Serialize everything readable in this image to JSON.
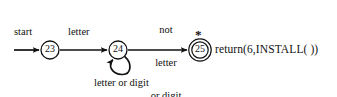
{
  "diagram": {
    "type": "finite-state-transition-diagram",
    "stroke_color": "#111111",
    "background_color": "#ffffff",
    "start_label": "start",
    "states": [
      {
        "id": "s23",
        "label": "23",
        "shape": "circle",
        "accepting": false,
        "cx": 50,
        "cy": 50,
        "r": 9
      },
      {
        "id": "s24",
        "label": "24",
        "shape": "circle",
        "accepting": false,
        "cx": 118,
        "cy": 50,
        "r": 9
      },
      {
        "id": "s25",
        "label": "25",
        "shape": "double-circle",
        "accepting": true,
        "cx": 200,
        "cy": 50,
        "r": 9,
        "r_outer": 11.5,
        "marker": "*"
      }
    ],
    "transitions": [
      {
        "id": "t-start",
        "from": "start",
        "to": "s23",
        "label": "start"
      },
      {
        "id": "t23-24",
        "from": "s23",
        "to": "s24",
        "label": "letter"
      },
      {
        "id": "t24-25",
        "from": "s24",
        "to": "s25",
        "label_lines": [
          "not",
          "letter",
          "or digit"
        ]
      },
      {
        "id": "t24-24",
        "from": "s24",
        "to": "s24",
        "label": "letter or digit",
        "self_loop": true
      }
    ],
    "accepting_marker": "*",
    "action": "return(6,INSTALL( ))"
  }
}
